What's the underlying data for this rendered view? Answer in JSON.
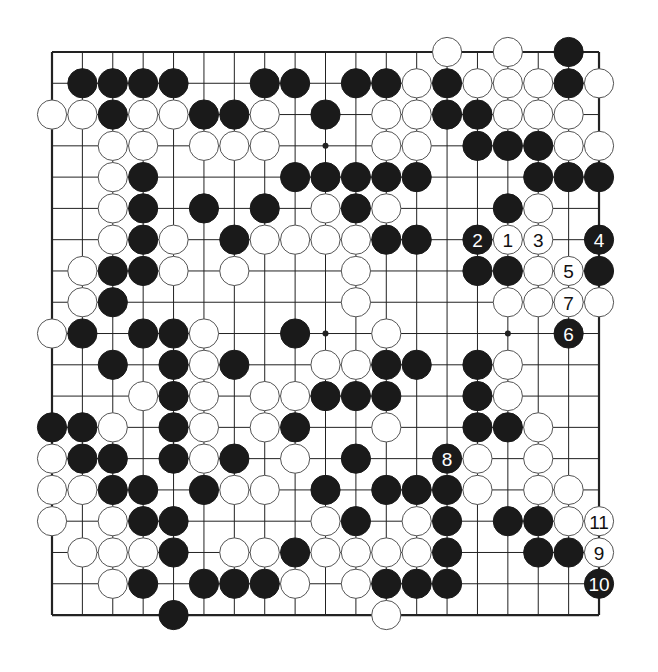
{
  "board": {
    "size": 19,
    "origin": {
      "x": 52,
      "y": 52
    },
    "spacing": {
      "x": 30.39,
      "y": 31.28
    },
    "line_color": "#222222",
    "border_color": "#222222",
    "star_points": [
      [
        3,
        3
      ],
      [
        3,
        9
      ],
      [
        3,
        15
      ],
      [
        9,
        3
      ],
      [
        9,
        9
      ],
      [
        9,
        15
      ],
      [
        15,
        3
      ],
      [
        15,
        9
      ],
      [
        15,
        15
      ]
    ],
    "visible_star_points": [
      [
        9,
        3
      ],
      [
        9,
        9
      ],
      [
        15,
        9
      ]
    ]
  },
  "colors": {
    "black_stone": "#1a1a1a",
    "white_stone": "#ffffff",
    "white_outline": "#555555",
    "background": "#ffffff"
  },
  "stones": {
    "black": [
      [
        17,
        0
      ],
      [
        1,
        1
      ],
      [
        2,
        1
      ],
      [
        3,
        1
      ],
      [
        4,
        1
      ],
      [
        7,
        1
      ],
      [
        8,
        1
      ],
      [
        10,
        1
      ],
      [
        11,
        1
      ],
      [
        13,
        1
      ],
      [
        17,
        1
      ],
      [
        2,
        2
      ],
      [
        5,
        2
      ],
      [
        6,
        2
      ],
      [
        9,
        2
      ],
      [
        13,
        2
      ],
      [
        14,
        2
      ],
      [
        14,
        3
      ],
      [
        15,
        3
      ],
      [
        16,
        3
      ],
      [
        3,
        4
      ],
      [
        8,
        4
      ],
      [
        9,
        4
      ],
      [
        10,
        4
      ],
      [
        11,
        4
      ],
      [
        12,
        4
      ],
      [
        16,
        4
      ],
      [
        17,
        4
      ],
      [
        18,
        4
      ],
      [
        3,
        5
      ],
      [
        5,
        5
      ],
      [
        7,
        5
      ],
      [
        10,
        5
      ],
      [
        15,
        5
      ],
      [
        3,
        6
      ],
      [
        6,
        6
      ],
      [
        11,
        6
      ],
      [
        12,
        6
      ],
      [
        2,
        7
      ],
      [
        3,
        7
      ],
      [
        14,
        7
      ],
      [
        15,
        7
      ],
      [
        18,
        7
      ],
      [
        2,
        8
      ],
      [
        1,
        9
      ],
      [
        3,
        9
      ],
      [
        4,
        9
      ],
      [
        8,
        9
      ],
      [
        2,
        10
      ],
      [
        4,
        10
      ],
      [
        6,
        10
      ],
      [
        11,
        10
      ],
      [
        12,
        10
      ],
      [
        14,
        10
      ],
      [
        4,
        11
      ],
      [
        9,
        11
      ],
      [
        10,
        11
      ],
      [
        11,
        11
      ],
      [
        14,
        11
      ],
      [
        0,
        12
      ],
      [
        1,
        12
      ],
      [
        4,
        12
      ],
      [
        8,
        12
      ],
      [
        14,
        12
      ],
      [
        15,
        12
      ],
      [
        1,
        13
      ],
      [
        2,
        13
      ],
      [
        4,
        13
      ],
      [
        6,
        13
      ],
      [
        10,
        13
      ],
      [
        2,
        14
      ],
      [
        3,
        14
      ],
      [
        5,
        14
      ],
      [
        9,
        14
      ],
      [
        11,
        14
      ],
      [
        12,
        14
      ],
      [
        13,
        14
      ],
      [
        3,
        15
      ],
      [
        4,
        15
      ],
      [
        10,
        15
      ],
      [
        13,
        15
      ],
      [
        15,
        15
      ],
      [
        16,
        15
      ],
      [
        4,
        16
      ],
      [
        8,
        16
      ],
      [
        13,
        16
      ],
      [
        16,
        16
      ],
      [
        17,
        16
      ],
      [
        3,
        17
      ],
      [
        5,
        17
      ],
      [
        6,
        17
      ],
      [
        7,
        17
      ],
      [
        11,
        17
      ],
      [
        12,
        17
      ],
      [
        13,
        17
      ],
      [
        4,
        18
      ]
    ],
    "white": [
      [
        13,
        0
      ],
      [
        15,
        0
      ],
      [
        12,
        1
      ],
      [
        14,
        1
      ],
      [
        15,
        1
      ],
      [
        16,
        1
      ],
      [
        18,
        1
      ],
      [
        0,
        2
      ],
      [
        1,
        2
      ],
      [
        3,
        2
      ],
      [
        4,
        2
      ],
      [
        7,
        2
      ],
      [
        11,
        2
      ],
      [
        12,
        2
      ],
      [
        15,
        2
      ],
      [
        16,
        2
      ],
      [
        17,
        2
      ],
      [
        2,
        3
      ],
      [
        3,
        3
      ],
      [
        5,
        3
      ],
      [
        6,
        3
      ],
      [
        7,
        3
      ],
      [
        11,
        3
      ],
      [
        12,
        3
      ],
      [
        17,
        3
      ],
      [
        18,
        3
      ],
      [
        2,
        4
      ],
      [
        2,
        5
      ],
      [
        9,
        5
      ],
      [
        11,
        5
      ],
      [
        16,
        5
      ],
      [
        2,
        6
      ],
      [
        4,
        6
      ],
      [
        7,
        6
      ],
      [
        8,
        6
      ],
      [
        9,
        6
      ],
      [
        10,
        6
      ],
      [
        1,
        7
      ],
      [
        4,
        7
      ],
      [
        6,
        7
      ],
      [
        10,
        7
      ],
      [
        16,
        7
      ],
      [
        1,
        8
      ],
      [
        10,
        8
      ],
      [
        15,
        8
      ],
      [
        16,
        8
      ],
      [
        18,
        8
      ],
      [
        0,
        9
      ],
      [
        5,
        9
      ],
      [
        11,
        9
      ],
      [
        5,
        10
      ],
      [
        9,
        10
      ],
      [
        10,
        10
      ],
      [
        15,
        10
      ],
      [
        3,
        11
      ],
      [
        5,
        11
      ],
      [
        7,
        11
      ],
      [
        8,
        11
      ],
      [
        15,
        11
      ],
      [
        2,
        12
      ],
      [
        5,
        12
      ],
      [
        7,
        12
      ],
      [
        11,
        12
      ],
      [
        16,
        12
      ],
      [
        0,
        13
      ],
      [
        5,
        13
      ],
      [
        8,
        13
      ],
      [
        14,
        13
      ],
      [
        16,
        13
      ],
      [
        0,
        14
      ],
      [
        1,
        14
      ],
      [
        6,
        14
      ],
      [
        7,
        14
      ],
      [
        14,
        14
      ],
      [
        16,
        14
      ],
      [
        17,
        14
      ],
      [
        0,
        15
      ],
      [
        2,
        15
      ],
      [
        9,
        15
      ],
      [
        12,
        15
      ],
      [
        17,
        15
      ],
      [
        1,
        16
      ],
      [
        2,
        16
      ],
      [
        3,
        16
      ],
      [
        6,
        16
      ],
      [
        7,
        16
      ],
      [
        9,
        16
      ],
      [
        10,
        16
      ],
      [
        11,
        16
      ],
      [
        12,
        16
      ],
      [
        2,
        17
      ],
      [
        8,
        17
      ],
      [
        10,
        17
      ],
      [
        11,
        18
      ]
    ]
  },
  "numbered_moves": [
    {
      "n": "1",
      "color": "white",
      "col": 15,
      "row": 6
    },
    {
      "n": "2",
      "color": "black",
      "col": 14,
      "row": 6
    },
    {
      "n": "3",
      "color": "white",
      "col": 16,
      "row": 6
    },
    {
      "n": "4",
      "color": "black",
      "col": 18,
      "row": 6
    },
    {
      "n": "5",
      "color": "white",
      "col": 17,
      "row": 7
    },
    {
      "n": "6",
      "color": "black",
      "col": 17,
      "row": 9
    },
    {
      "n": "7",
      "color": "white",
      "col": 17,
      "row": 8
    },
    {
      "n": "8",
      "color": "black",
      "col": 13,
      "row": 13
    },
    {
      "n": "9",
      "color": "white",
      "col": 18,
      "row": 16
    },
    {
      "n": "10",
      "color": "black",
      "col": 18,
      "row": 17
    },
    {
      "n": "11",
      "color": "white",
      "col": 18,
      "row": 15
    }
  ]
}
